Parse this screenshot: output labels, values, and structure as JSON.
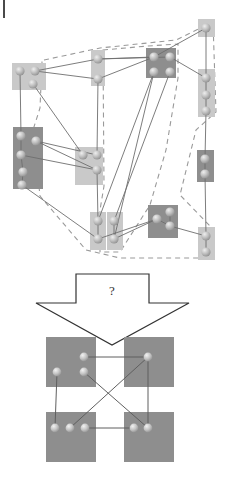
{
  "figure": {
    "corner_mark": "|",
    "transition_label": "?",
    "colors": {
      "background": "#ffffff",
      "cluster_light": "#c9c9c9",
      "cluster_dark": "#8e8e8e",
      "result_block": "#8e8e8e",
      "node_fill": "#b5b5b5",
      "node_highlight": "#e4e4e4",
      "edge": "#6e6e6e",
      "dashed_boundary": "#9a9a9a",
      "arrow_outline": "#333333",
      "arrow_fill": "#ffffff"
    },
    "top_panel": {
      "name": "input-graph",
      "description": "clustered graph with dashed community boundaries",
      "clusters": [
        {
          "id": "c1",
          "shade": "light",
          "x": 12,
          "y": 63,
          "w": 34,
          "h": 27,
          "nodes": [
            [
              20,
              71
            ],
            [
              35,
              71
            ],
            [
              33,
              84
            ]
          ]
        },
        {
          "id": "c2",
          "shade": "light",
          "x": 91,
          "y": 50,
          "w": 14,
          "h": 36,
          "nodes": [
            [
              98,
              59
            ],
            [
              98,
              79
            ]
          ]
        },
        {
          "id": "c3",
          "shade": "dark",
          "x": 146,
          "y": 48,
          "w": 30,
          "h": 30,
          "nodes": [
            [
              154,
              57
            ],
            [
              170,
              57
            ],
            [
              154,
              72
            ],
            [
              170,
              72
            ]
          ]
        },
        {
          "id": "c4",
          "shade": "light",
          "x": 198,
          "y": 19,
          "w": 17,
          "h": 18,
          "nodes": [
            [
              206,
              28
            ]
          ]
        },
        {
          "id": "c5",
          "shade": "light",
          "x": 198,
          "y": 69,
          "w": 17,
          "h": 48,
          "nodes": [
            [
              206,
              78
            ],
            [
              206,
              95
            ],
            [
              206,
              111
            ]
          ]
        },
        {
          "id": "c6",
          "shade": "dark",
          "x": 13,
          "y": 127,
          "w": 30,
          "h": 62,
          "nodes": [
            [
              21,
              136
            ],
            [
              36,
              141
            ],
            [
              21,
              155
            ],
            [
              23,
              172
            ],
            [
              22,
              185
            ]
          ]
        },
        {
          "id": "c7",
          "shade": "light",
          "x": 75,
          "y": 147,
          "w": 28,
          "h": 38,
          "nodes": [
            [
              83,
              155
            ],
            [
              97,
              155
            ],
            [
              97,
              170
            ]
          ]
        },
        {
          "id": "c8",
          "shade": "dark",
          "x": 197,
          "y": 150,
          "w": 17,
          "h": 32,
          "nodes": [
            [
              205,
              159
            ],
            [
              205,
              174
            ]
          ]
        },
        {
          "id": "c9",
          "shade": "light",
          "x": 90,
          "y": 212,
          "w": 16,
          "h": 38,
          "nodes": [
            [
              98,
              221
            ],
            [
              98,
              239
            ]
          ]
        },
        {
          "id": "c10",
          "shade": "light",
          "x": 107,
          "y": 212,
          "w": 16,
          "h": 38,
          "nodes": [
            [
              114,
              221
            ],
            [
              114,
              239
            ]
          ]
        },
        {
          "id": "c11",
          "shade": "dark",
          "x": 148,
          "y": 205,
          "w": 30,
          "h": 33,
          "nodes": [
            [
              157,
              219
            ],
            [
              170,
              212
            ],
            [
              170,
              226
            ]
          ]
        },
        {
          "id": "c12",
          "shade": "light",
          "x": 198,
          "y": 227,
          "w": 17,
          "h": 33,
          "nodes": [
            [
              206,
              236
            ],
            [
              206,
              252
            ]
          ]
        }
      ],
      "edges": [
        [
          35,
          71,
          98,
          59
        ],
        [
          35,
          71,
          98,
          79
        ],
        [
          20,
          71,
          21,
          136
        ],
        [
          33,
          84,
          83,
          155
        ],
        [
          36,
          141,
          97,
          155
        ],
        [
          36,
          141,
          97,
          170
        ],
        [
          21,
          155,
          97,
          170
        ],
        [
          22,
          185,
          98,
          239
        ],
        [
          98,
          79,
          154,
          57
        ],
        [
          98,
          79,
          97,
          155
        ],
        [
          98,
          59,
          154,
          57
        ],
        [
          98,
          59,
          170,
          57
        ],
        [
          154,
          57,
          206,
          28
        ],
        [
          170,
          57,
          206,
          78
        ],
        [
          206,
          28,
          206,
          78
        ],
        [
          206,
          78,
          206,
          95
        ],
        [
          206,
          95,
          206,
          111
        ],
        [
          206,
          111,
          205,
          159
        ],
        [
          205,
          159,
          205,
          174
        ],
        [
          205,
          174,
          206,
          236
        ],
        [
          206,
          236,
          206,
          252
        ],
        [
          154,
          72,
          98,
          221
        ],
        [
          154,
          72,
          114,
          239
        ],
        [
          170,
          72,
          114,
          221
        ],
        [
          97,
          170,
          98,
          221
        ],
        [
          98,
          221,
          98,
          239
        ],
        [
          114,
          221,
          114,
          239
        ],
        [
          98,
          239,
          157,
          219
        ],
        [
          114,
          239,
          157,
          219
        ],
        [
          157,
          219,
          170,
          226
        ],
        [
          170,
          212,
          170,
          226
        ],
        [
          170,
          226,
          206,
          236
        ],
        [
          21,
          136,
          21,
          155
        ],
        [
          21,
          155,
          23,
          172
        ],
        [
          23,
          172,
          22,
          185
        ]
      ],
      "dashed_boundaries": [
        [
          [
            44,
            60
          ],
          [
            100,
            48
          ],
          [
            176,
            40
          ],
          [
            213,
            22
          ],
          [
            216,
            112
          ],
          [
            196,
            130
          ],
          [
            180,
            195
          ],
          [
            210,
            226
          ],
          [
            214,
            258
          ],
          [
            120,
            258
          ],
          [
            86,
            250
          ],
          [
            40,
            196
          ],
          [
            33,
            130
          ],
          [
            40,
            108
          ],
          [
            42,
            62
          ]
        ],
        [
          [
            103,
            50
          ],
          [
            148,
            46
          ],
          [
            178,
            44
          ],
          [
            178,
            78
          ],
          [
            166,
            150
          ],
          [
            150,
            205
          ],
          [
            120,
            252
          ],
          [
            100,
            252
          ],
          [
            100,
            210
          ],
          [
            104,
            186
          ],
          [
            103,
            52
          ]
        ]
      ]
    },
    "arrow": {
      "name": "transition-arrow",
      "label": "?",
      "direction": "down"
    },
    "bottom_panel": {
      "name": "output-graph",
      "description": "four resolved clusters in 2x2 grid",
      "blocks": [
        {
          "id": "b-tl",
          "x": 46,
          "y": 337,
          "w": 50,
          "h": 50,
          "nodes": [
            [
              84,
              357
            ],
            [
              57,
              372
            ],
            [
              84,
              372
            ]
          ]
        },
        {
          "id": "b-tr",
          "x": 124,
          "y": 337,
          "w": 50,
          "h": 50,
          "nodes": [
            [
              148,
              357
            ]
          ]
        },
        {
          "id": "b-bl",
          "x": 46,
          "y": 412,
          "w": 50,
          "h": 50,
          "nodes": [
            [
              55,
              428
            ],
            [
              70,
              428
            ],
            [
              85,
              428
            ]
          ]
        },
        {
          "id": "b-br",
          "x": 124,
          "y": 412,
          "w": 50,
          "h": 50,
          "nodes": [
            [
              134,
              428
            ],
            [
              148,
              428
            ]
          ]
        }
      ],
      "edges": [
        [
          84,
          357,
          148,
          357
        ],
        [
          57,
          372,
          55,
          428
        ],
        [
          84,
          372,
          148,
          428
        ],
        [
          148,
          357,
          70,
          428
        ],
        [
          148,
          357,
          148,
          428
        ],
        [
          85,
          428,
          134,
          428
        ]
      ]
    }
  }
}
